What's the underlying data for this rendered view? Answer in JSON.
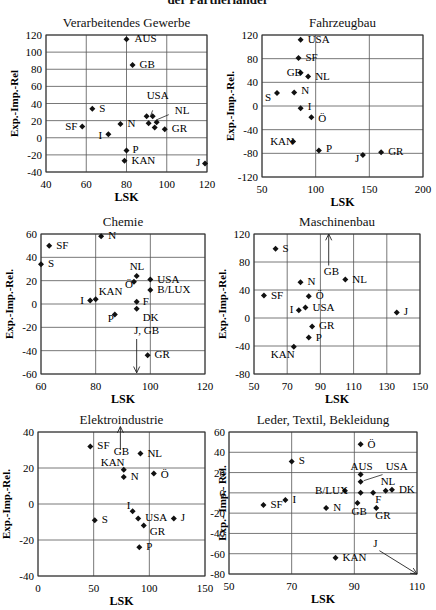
{
  "header": {
    "title": "der Partnerländer"
  },
  "chart_data": [
    {
      "id": "c1",
      "type": "scatter",
      "title": "Verarbeitendes Gewerbe",
      "xlabel": "LSK",
      "ylabel": "Exp.-Imp.-Rel",
      "xlim": [
        40,
        120
      ],
      "ylim": [
        -40,
        120
      ],
      "xticks": [
        40,
        60,
        80,
        100,
        120
      ],
      "yticks": [
        -40,
        -20,
        0,
        20,
        40,
        60,
        80,
        100,
        120
      ],
      "grid": true,
      "box": {
        "x": 0,
        "y": 0,
        "l": 46,
        "t": 35,
        "r": 207,
        "b": 172
      },
      "points": [
        {
          "label": "AUS",
          "x": 80,
          "y": 115,
          "lx": 8,
          "ly": 3
        },
        {
          "label": "GB",
          "x": 83,
          "y": 85,
          "lx": 7,
          "ly": 3
        },
        {
          "label": "S",
          "x": 63,
          "y": 34,
          "lx": 7,
          "ly": 3
        },
        {
          "label": "SF",
          "x": 58,
          "y": 13,
          "lx": -17,
          "ly": 3
        },
        {
          "label": "N",
          "x": 77,
          "y": 16,
          "lx": 7,
          "ly": 3
        },
        {
          "label": "I",
          "x": 71,
          "y": 4,
          "lx": -10,
          "ly": 5
        },
        {
          "label": "",
          "x": 90,
          "y": 25
        },
        {
          "label": "",
          "x": 93,
          "y": 25
        },
        {
          "label": "",
          "x": 91,
          "y": 17
        },
        {
          "label": "",
          "x": 95,
          "y": 18
        },
        {
          "label": "",
          "x": 94,
          "y": 12
        },
        {
          "label": "GR",
          "x": 99,
          "y": 10,
          "lx": 7,
          "ly": 3
        },
        {
          "label": "P",
          "x": 80,
          "y": -15,
          "lx": 6,
          "ly": 2
        },
        {
          "label": "KAN",
          "x": 79,
          "y": -27,
          "lx": 7,
          "ly": 3
        },
        {
          "label": "J",
          "x": 119,
          "y": -30,
          "lx": -9,
          "ly": 3
        }
      ],
      "annotations": [
        {
          "text": "USA",
          "tx": 90,
          "ty": 45,
          "line": [
            93,
            32,
            92,
            26
          ]
        },
        {
          "text": "NL",
          "tx": 104,
          "ty": 28,
          "line": [
            101,
            27,
            95,
            21
          ]
        }
      ],
      "arrows": []
    },
    {
      "id": "c2",
      "type": "scatter",
      "title": "Fahrzeugbau",
      "xlabel": "LSK",
      "ylabel": "Exp.-Imp.-Rel.",
      "xlim": [
        50,
        200
      ],
      "ylim": [
        -120,
        120
      ],
      "xticks": [
        50,
        100,
        150,
        200
      ],
      "yticks": [
        -120,
        -80,
        -40,
        0,
        40,
        80,
        120
      ],
      "grid": true,
      "box": {
        "x": 218,
        "y": 0,
        "l": 44,
        "t": 35,
        "r": 205,
        "b": 177
      },
      "points": [
        {
          "label": "USA",
          "x": 86,
          "y": 112,
          "lx": 7,
          "ly": 3
        },
        {
          "label": "SF",
          "x": 84,
          "y": 81,
          "lx": 7,
          "ly": 3
        },
        {
          "label": "GB",
          "x": 86,
          "y": 56,
          "lx": -14,
          "ly": 3
        },
        {
          "label": "NL",
          "x": 93,
          "y": 50,
          "lx": 7,
          "ly": 4
        },
        {
          "label": "S",
          "x": 64,
          "y": 22,
          "lx": -12,
          "ly": 8
        },
        {
          "label": "N",
          "x": 80,
          "y": 23,
          "lx": 7,
          "ly": 2
        },
        {
          "label": "I",
          "x": 86,
          "y": -4,
          "lx": 7,
          "ly": 2
        },
        {
          "label": "Ö",
          "x": 96,
          "y": -19,
          "lx": 7,
          "ly": 5
        },
        {
          "label": "KAN",
          "x": 79,
          "y": -60,
          "lx": -23,
          "ly": 3
        },
        {
          "label": "P",
          "x": 103,
          "y": -75,
          "lx": 7,
          "ly": 2
        },
        {
          "label": "J",
          "x": 144,
          "y": -83,
          "lx": -8,
          "ly": 7
        },
        {
          "label": "GR",
          "x": 161,
          "y": -78,
          "lx": 7,
          "ly": 3
        }
      ],
      "annotations": [],
      "arrows": []
    },
    {
      "id": "c3",
      "type": "scatter",
      "title": "Chemie",
      "xlabel": "LSK",
      "ylabel": "Exp.-Imp.-Rel.",
      "xlim": [
        60,
        120
      ],
      "ylim": [
        -60,
        60
      ],
      "xticks": [
        60,
        80,
        100,
        120
      ],
      "yticks": [
        -60,
        -40,
        -20,
        0,
        20,
        40,
        60
      ],
      "grid": true,
      "box": {
        "x": 0,
        "y": 200,
        "l": 41,
        "t": 34,
        "r": 205,
        "b": 174
      },
      "points": [
        {
          "label": "N",
          "x": 82,
          "y": 58,
          "lx": 7,
          "ly": 3
        },
        {
          "label": "SF",
          "x": 63,
          "y": 50,
          "lx": 7,
          "ly": 3
        },
        {
          "label": "S",
          "x": 60,
          "y": 34,
          "lx": 7,
          "ly": 3
        },
        {
          "label": "NL",
          "x": 95,
          "y": 24,
          "lx": -7,
          "ly": -6
        },
        {
          "label": "Ö",
          "x": 94,
          "y": 19,
          "lx": -9,
          "ly": 6
        },
        {
          "label": "USA",
          "x": 100,
          "y": 21,
          "lx": 7,
          "ly": 3
        },
        {
          "label": "B/LUX",
          "x": 100,
          "y": 12,
          "lx": 7,
          "ly": 3
        },
        {
          "label": "I",
          "x": 78,
          "y": 3,
          "lx": -10,
          "ly": 3
        },
        {
          "label": "KAN",
          "x": 80,
          "y": 4,
          "lx": 3,
          "ly": -4
        },
        {
          "label": "F",
          "x": 95,
          "y": 2,
          "lx": 6,
          "ly": 3
        },
        {
          "label": "DK",
          "x": 95,
          "y": -4,
          "lx": 0,
          "ly": 12
        },
        {
          "label": "P",
          "x": 87,
          "y": -9,
          "lx": -7,
          "ly": 7
        },
        {
          "label": "GR",
          "x": 99,
          "y": -44,
          "lx": 7,
          "ly": 3
        }
      ],
      "annotations": [
        {
          "text": "J, GB",
          "tx": 94,
          "ty": -26,
          "line": null
        }
      ],
      "arrows": [
        {
          "x1": 95,
          "y1": -30,
          "x2": 95,
          "y2": -59
        }
      ]
    },
    {
      "id": "c4",
      "type": "scatter",
      "title": "Maschinenbau",
      "xlabel": "LSK",
      "ylabel": "Exp.-Imp.-Rel.",
      "xlim": [
        50,
        150
      ],
      "ylim": [
        -80,
        120
      ],
      "xticks": [
        50,
        70,
        90,
        110,
        130,
        150
      ],
      "yticks": [
        -80,
        -40,
        0,
        40,
        80,
        120
      ],
      "grid": true,
      "box": {
        "x": 218,
        "y": 200,
        "l": 36,
        "t": 34,
        "r": 202,
        "b": 174
      },
      "points": [
        {
          "label": "S",
          "x": 63,
          "y": 99,
          "lx": 7,
          "ly": 3
        },
        {
          "label": "NL",
          "x": 105,
          "y": 55,
          "lx": 7,
          "ly": 3
        },
        {
          "label": "N",
          "x": 78,
          "y": 51,
          "lx": 7,
          "ly": 3
        },
        {
          "label": "SF",
          "x": 56,
          "y": 32,
          "lx": 7,
          "ly": 3
        },
        {
          "label": "Ö",
          "x": 83,
          "y": 31,
          "lx": 7,
          "ly": 3
        },
        {
          "label": "I",
          "x": 77,
          "y": 11,
          "lx": -9,
          "ly": 3
        },
        {
          "label": "USA",
          "x": 81,
          "y": 15,
          "lx": 7,
          "ly": 3
        },
        {
          "label": "J",
          "x": 136,
          "y": 8,
          "lx": 7,
          "ly": 3
        },
        {
          "label": "GR",
          "x": 85,
          "y": -12,
          "lx": 7,
          "ly": 3
        },
        {
          "label": "P",
          "x": 83,
          "y": -28,
          "lx": 7,
          "ly": 3
        },
        {
          "label": "KAN",
          "x": 74,
          "y": -41,
          "lx": -23,
          "ly": 11
        }
      ],
      "annotations": [
        {
          "text": "GB",
          "tx": 92,
          "ty": 62,
          "line": null
        }
      ],
      "arrows": [
        {
          "x1": 95,
          "y1": 75,
          "x2": 95,
          "y2": 120
        }
      ]
    },
    {
      "id": "c5",
      "type": "scatter",
      "title": "Elektroindustrie",
      "xlabel": "LSK",
      "ylabel": "Exp.-Imp.-Rel.",
      "xlim": [
        0,
        150
      ],
      "ylim": [
        -40,
        40
      ],
      "xticks": [
        0,
        50,
        100,
        150
      ],
      "yticks": [
        -40,
        -20,
        0,
        20,
        40
      ],
      "grid": true,
      "box": {
        "x": 0,
        "y": 405,
        "l": 38,
        "t": 27,
        "r": 205,
        "b": 171
      },
      "points": [
        {
          "label": "SF",
          "x": 47,
          "y": 32,
          "lx": 7,
          "ly": 3
        },
        {
          "label": "NL",
          "x": 92,
          "y": 28,
          "lx": 7,
          "ly": 3
        },
        {
          "label": "KAN",
          "x": 77,
          "y": 19,
          "lx": -23,
          "ly": -4
        },
        {
          "label": "N",
          "x": 77,
          "y": 15,
          "lx": 7,
          "ly": 3
        },
        {
          "label": "Ö",
          "x": 104,
          "y": 17,
          "lx": 7,
          "ly": 5
        },
        {
          "label": "I",
          "x": 85,
          "y": -4,
          "lx": -6,
          "ly": -2
        },
        {
          "label": "S",
          "x": 51,
          "y": -9,
          "lx": 7,
          "ly": 3
        },
        {
          "label": "USA",
          "x": 90,
          "y": -8,
          "lx": 7,
          "ly": 3
        },
        {
          "label": "J",
          "x": 122,
          "y": -8,
          "lx": 7,
          "ly": 3
        },
        {
          "label": "GR",
          "x": 95,
          "y": -12,
          "lx": 6,
          "ly": 9
        },
        {
          "label": "P",
          "x": 91,
          "y": -24,
          "lx": 7,
          "ly": 3
        }
      ],
      "annotations": [
        {
          "text": "GB",
          "tx": 68,
          "ty": 27,
          "line": null
        }
      ],
      "arrows": [
        {
          "x1": 74,
          "y1": 30,
          "x2": 74,
          "y2": 43
        }
      ]
    },
    {
      "id": "c6",
      "type": "scatter",
      "title": "Leder, Textil, Bekleidung",
      "xlabel": "LSK",
      "ylabel": "Exp.- Imp.- Rel.",
      "xlim": [
        50,
        110
      ],
      "ylim": [
        -80,
        60
      ],
      "xticks": [
        50,
        70,
        90,
        110
      ],
      "yticks": [
        -80,
        -60,
        -40,
        -20,
        0,
        20,
        40,
        60
      ],
      "grid": true,
      "box": {
        "x": 218,
        "y": 405,
        "l": 11,
        "t": 27,
        "r": 199,
        "b": 169
      },
      "points": [
        {
          "label": "Ö",
          "x": 92,
          "y": 48,
          "lx": 7,
          "ly": 4
        },
        {
          "label": "S",
          "x": 70,
          "y": 31,
          "lx": 7,
          "ly": 3
        },
        {
          "label": "AUS",
          "x": 92,
          "y": 18,
          "lx": -10,
          "ly": -5
        },
        {
          "label": "",
          "x": 92,
          "y": 11
        },
        {
          "label": "B/LUX",
          "x": 87,
          "y": 2,
          "lx": -30,
          "ly": 0
        },
        {
          "label": "",
          "x": 92,
          "y": 0
        },
        {
          "label": "F",
          "x": 96,
          "y": 0,
          "lx": 2,
          "ly": 10
        },
        {
          "label": "NL",
          "x": 100,
          "y": 2,
          "lx": -5,
          "ly": -6
        },
        {
          "label": "DK",
          "x": 102,
          "y": 3,
          "lx": 7,
          "ly": 3
        },
        {
          "label": "I",
          "x": 68,
          "y": -7,
          "lx": 7,
          "ly": 3
        },
        {
          "label": "SF",
          "x": 61,
          "y": -12,
          "lx": 7,
          "ly": 3
        },
        {
          "label": "N",
          "x": 81,
          "y": -15,
          "lx": 7,
          "ly": 3
        },
        {
          "label": "GB",
          "x": 91,
          "y": -10,
          "lx": -6,
          "ly": 12
        },
        {
          "label": "GR",
          "x": 97,
          "y": -15,
          "lx": -1,
          "ly": 11
        },
        {
          "label": "KAN",
          "x": 84,
          "y": -64,
          "lx": 7,
          "ly": 3
        }
      ],
      "annotations": [
        {
          "text": "USA",
          "tx": 100,
          "ty": 23,
          "line": [
            99,
            18,
            93,
            12
          ]
        },
        {
          "text": "J",
          "tx": 96,
          "ty": -53,
          "line": null
        }
      ],
      "arrows": [
        {
          "x1": 98,
          "y1": -57,
          "x2": 110,
          "y2": -80
        }
      ]
    }
  ]
}
